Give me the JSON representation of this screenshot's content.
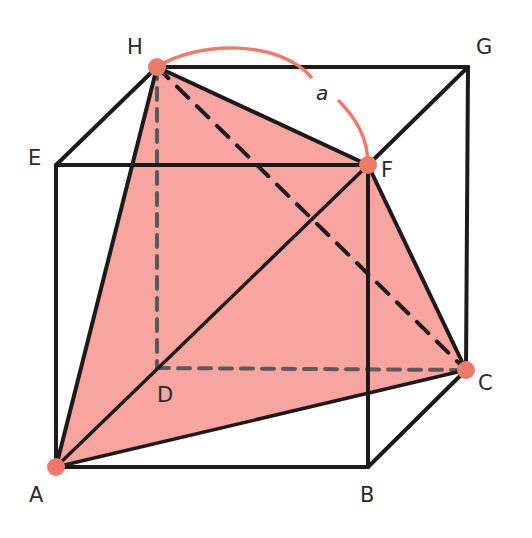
{
  "figure": {
    "type": "cube-diagram",
    "colors": {
      "shaded_face": "#f8a5a2",
      "highlight": "#f07a6a",
      "edge": "#1e1a1a",
      "hidden_edge": "#5a5a5a"
    },
    "vertices": {
      "A": {
        "label": "A",
        "highlighted": true
      },
      "B": {
        "label": "B",
        "highlighted": false
      },
      "C": {
        "label": "C",
        "highlighted": true
      },
      "D": {
        "label": "D",
        "highlighted": false
      },
      "E": {
        "label": "E",
        "highlighted": false
      },
      "F": {
        "label": "F",
        "highlighted": true
      },
      "G": {
        "label": "G",
        "highlighted": false
      },
      "H": {
        "label": "H",
        "highlighted": true
      }
    },
    "solid_edges": [
      [
        "A",
        "B"
      ],
      [
        "B",
        "C"
      ],
      [
        "A",
        "E"
      ],
      [
        "B",
        "F"
      ],
      [
        "C",
        "G"
      ],
      [
        "E",
        "F"
      ],
      [
        "F",
        "G"
      ],
      [
        "G",
        "H"
      ],
      [
        "H",
        "E"
      ]
    ],
    "hidden_edges": [
      [
        "H",
        "D"
      ],
      [
        "D",
        "C"
      ],
      [
        "A",
        "D"
      ]
    ],
    "tetrahedron_edges_solid": [
      [
        "H",
        "F"
      ],
      [
        "H",
        "A"
      ],
      [
        "F",
        "A"
      ],
      [
        "F",
        "C"
      ],
      [
        "A",
        "C"
      ]
    ],
    "tetrahedron_edges_dashed": [
      [
        "H",
        "C"
      ]
    ],
    "arc": {
      "from": "H",
      "to": "F",
      "label": "a"
    }
  }
}
